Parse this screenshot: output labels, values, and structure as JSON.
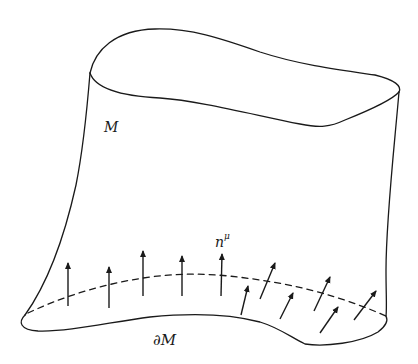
{
  "figure": {
    "stroke_color": "#1a1a1a",
    "background": "#ffffff"
  },
  "labels": {
    "manifold": "M",
    "boundary": "∂M",
    "normal_base": "n",
    "normal_superscript": "μ"
  },
  "normal_vectors": {
    "count": 12,
    "upright": [
      {
        "x": 68,
        "y1": 306,
        "y2": 262
      },
      {
        "x": 109,
        "y1": 307,
        "y2": 266
      },
      {
        "x": 143,
        "y1": 296,
        "y2": 250
      },
      {
        "x": 182,
        "y1": 296,
        "y2": 255
      },
      {
        "x": 221,
        "y1": 296,
        "y2": 253
      }
    ],
    "tilted": [
      {
        "x1": 241,
        "y1": 315,
        "x2": 249,
        "y2": 285
      },
      {
        "x1": 260,
        "y1": 299,
        "x2": 276,
        "y2": 262
      },
      {
        "x1": 280,
        "y1": 319,
        "x2": 294,
        "y2": 292
      },
      {
        "x1": 314,
        "y1": 311,
        "x2": 331,
        "y2": 276
      },
      {
        "x1": 320,
        "y1": 333,
        "x2": 339,
        "y2": 306
      },
      {
        "x1": 354,
        "y1": 320,
        "x2": 377,
        "y2": 290
      }
    ]
  }
}
